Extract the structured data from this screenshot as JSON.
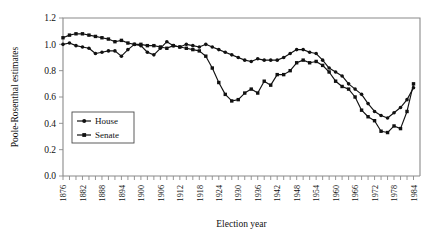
{
  "chart_data": {
    "type": "line",
    "title": "",
    "xlabel": "Election year",
    "ylabel": "Poole-Rosenthal estimates",
    "xlim": [
      1876,
      1986
    ],
    "ylim": [
      0.0,
      1.2
    ],
    "grid": false,
    "legend_position": "center-left",
    "ytick_labels": [
      "0.0",
      "0.2",
      "0.4",
      "0.6",
      "0.8",
      "1.0",
      "1.2"
    ],
    "ytick_values": [
      0.0,
      0.2,
      0.4,
      0.6,
      0.8,
      1.0,
      1.2
    ],
    "xtick_labels": [
      "1876",
      "1882",
      "1888",
      "1894",
      "1900",
      "1906",
      "1912",
      "1918",
      "1924",
      "1930",
      "1936",
      "1942",
      "1948",
      "1954",
      "1960",
      "1966",
      "1972",
      "1978",
      "1984"
    ],
    "xtick_values": [
      1876,
      1882,
      1888,
      1894,
      1900,
      1906,
      1912,
      1918,
      1924,
      1930,
      1936,
      1942,
      1948,
      1954,
      1960,
      1966,
      1972,
      1978,
      1984
    ],
    "minor_tick_step": 2,
    "x": [
      1876,
      1878,
      1880,
      1882,
      1884,
      1886,
      1888,
      1890,
      1892,
      1894,
      1896,
      1898,
      1900,
      1902,
      1904,
      1906,
      1908,
      1910,
      1912,
      1914,
      1916,
      1918,
      1920,
      1922,
      1924,
      1926,
      1928,
      1930,
      1932,
      1934,
      1936,
      1938,
      1940,
      1942,
      1944,
      1946,
      1948,
      1950,
      1952,
      1954,
      1956,
      1958,
      1960,
      1962,
      1964,
      1966,
      1968,
      1970,
      1972,
      1974,
      1976,
      1978,
      1980,
      1982,
      1984
    ],
    "series": [
      {
        "name": "House",
        "color": "#111111",
        "marker": "circle",
        "values": [
          1.0,
          1.01,
          0.99,
          0.98,
          0.97,
          0.93,
          0.94,
          0.95,
          0.95,
          0.91,
          0.96,
          1.0,
          0.99,
          0.94,
          0.92,
          0.97,
          1.02,
          0.99,
          0.98,
          1.0,
          0.99,
          0.98,
          1.0,
          0.98,
          0.96,
          0.94,
          0.92,
          0.9,
          0.88,
          0.87,
          0.89,
          0.88,
          0.88,
          0.88,
          0.9,
          0.93,
          0.96,
          0.96,
          0.94,
          0.93,
          0.88,
          0.82,
          0.79,
          0.76,
          0.7,
          0.66,
          0.62,
          0.55,
          0.49,
          0.46,
          0.44,
          0.48,
          0.52,
          0.58,
          0.67
        ]
      },
      {
        "name": "Senate",
        "color": "#111111",
        "marker": "square",
        "values": [
          1.05,
          1.07,
          1.08,
          1.08,
          1.07,
          1.06,
          1.05,
          1.04,
          1.02,
          1.03,
          1.01,
          1.0,
          1.0,
          0.99,
          0.99,
          0.98,
          0.97,
          0.99,
          0.98,
          0.97,
          0.96,
          0.95,
          0.91,
          0.82,
          0.71,
          0.62,
          0.57,
          0.58,
          0.63,
          0.66,
          0.63,
          0.72,
          0.69,
          0.77,
          0.77,
          0.8,
          0.86,
          0.88,
          0.86,
          0.87,
          0.84,
          0.79,
          0.72,
          0.68,
          0.66,
          0.6,
          0.5,
          0.45,
          0.42,
          0.34,
          0.33,
          0.38,
          0.36,
          0.49,
          0.7
        ]
      }
    ]
  },
  "legend": {
    "items": [
      {
        "label": "House"
      },
      {
        "label": "Senate"
      }
    ]
  }
}
